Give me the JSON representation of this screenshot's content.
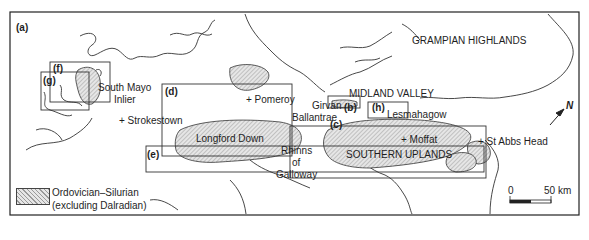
{
  "figure": {
    "panel_label": "(a)",
    "region_labels": {
      "grampian": "GRAMPIAN HIGHLANDS",
      "midland": "MIDLAND VALLEY",
      "southern": "SOUTHERN UPLANDS",
      "longford": "Longford Down",
      "south_mayo_1": "South Mayo",
      "south_mayo_2": "Inlier",
      "rhinns_1": "Rhinns",
      "rhinns_2": "of",
      "rhinns_3": "Galloway"
    },
    "place_labels": {
      "pomeroy": "+ Pomeroy",
      "strokestown": "+ Strokestown",
      "girvan": "Girvan",
      "ballantrae": "Ballantrae",
      "lesmahagow": "Lesmahagow",
      "moffat": "+ Moffat",
      "st_abbs": "+ St Abbs Head"
    },
    "inset_boxes": [
      "(b)",
      "(c)",
      "(d)",
      "(e)",
      "(f)",
      "(g)",
      "(h)"
    ],
    "north_arrow": "N",
    "scale_bar": {
      "start": "0",
      "end": "50 km"
    },
    "legend": {
      "line1": "Ordovician–Silurian",
      "line2": "(excluding Dalradian)"
    },
    "colors": {
      "ink": "#1e1e1e",
      "hatch": "#c8c8c8",
      "background": "#ffffff"
    }
  }
}
